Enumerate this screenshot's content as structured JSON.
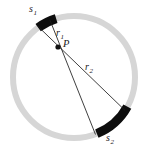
{
  "figure": {
    "background_color": "#ffffff",
    "canvas": {
      "width": 150,
      "height": 158
    },
    "ring": {
      "name": "annulus",
      "center_x": 74,
      "center_y": 77,
      "radius": 61,
      "thickness": 6,
      "color": "#d6d6d6"
    },
    "point_p": {
      "label": "P",
      "x": 58,
      "y": 47,
      "radius": 2.6,
      "color": "#111111"
    },
    "arcs": [
      {
        "id": "s1",
        "label": "s",
        "subscript": "1",
        "color": "#0d0d0d",
        "start_angle_deg": 126,
        "end_angle_deg": 107,
        "thickness": 9
      },
      {
        "id": "s2",
        "label": "s",
        "subscript": "2",
        "color": "#0d0d0d",
        "start_angle_deg": -68,
        "end_angle_deg": -29,
        "thickness": 9
      }
    ],
    "rays": [
      {
        "id": "ray-a",
        "x1": 39,
        "y1": 24,
        "x2": 120,
        "y2": 120,
        "color": "#1a1a1a",
        "width": 0.8
      },
      {
        "id": "ray-b",
        "x1": 47,
        "y1": 27,
        "x2": 88,
        "y2": 135,
        "color": "#1a1a1a",
        "width": 0.8
      }
    ],
    "labels": {
      "s1": {
        "base": "s",
        "sub": "1"
      },
      "r1": {
        "base": "r",
        "sub": "1"
      },
      "p": {
        "base": "P",
        "sub": ""
      },
      "r2": {
        "base": "r",
        "sub": "2"
      },
      "s2": {
        "base": "s",
        "sub": "2"
      }
    }
  }
}
